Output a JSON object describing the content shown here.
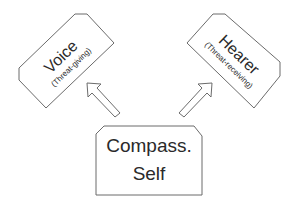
{
  "diagram": {
    "nodes": [
      {
        "id": "voice",
        "title": "Voice",
        "subtitle": "(Threat-giving)"
      },
      {
        "id": "hearer",
        "title": "Hearer",
        "subtitle": "(Threat-receiving)"
      },
      {
        "id": "self",
        "line1": "Compass.",
        "line2": "Self"
      }
    ],
    "edges": [
      {
        "from": "self",
        "to": "voice",
        "style": "block-arrow"
      },
      {
        "from": "self",
        "to": "hearer",
        "style": "block-arrow"
      }
    ],
    "colors": {
      "stroke": "#6b6b6b",
      "text": "#2a2a2a",
      "fill": "#ffffff"
    }
  }
}
